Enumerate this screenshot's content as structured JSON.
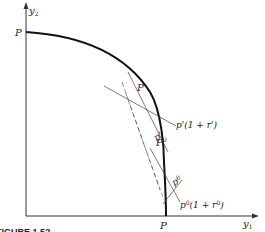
{
  "axes": {
    "y_axis_label": "y",
    "y_axis_sub": "2",
    "x_axis_label": "y",
    "x_axis_sub": "1"
  },
  "points": {
    "top_intercept": "P",
    "bottom_intercept": "P",
    "point_prime": "P'",
    "point_zero_base": "P",
    "point_zero_sup": "0"
  },
  "price_lines": {
    "p_prime_label": "p'",
    "p_prime_one_plus_r_label": "p'(1 + r')",
    "p_zero_base": "p",
    "p_zero_sup": "0",
    "p_zero_one_plus_r_base": "p",
    "p_zero_one_plus_r_sup": "0",
    "p_zero_one_plus_r_tail": "(1 + r",
    "p_zero_one_plus_r_sup2": "0",
    "p_zero_one_plus_r_close": ")"
  },
  "caption": "FIGURE 1.5?"
}
